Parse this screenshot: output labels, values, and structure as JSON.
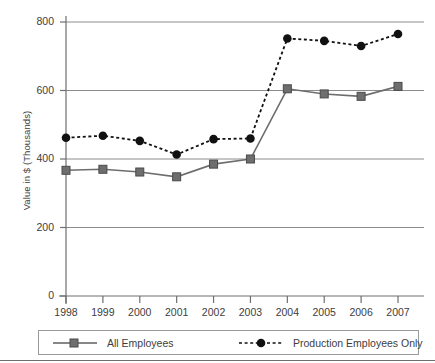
{
  "chart_data": {
    "type": "line",
    "title": "",
    "xlabel": "",
    "ylabel": "Value in $ (Thousands)",
    "categories": [
      "1998",
      "1999",
      "2000",
      "2001",
      "2002",
      "2003",
      "2004",
      "2005",
      "2006",
      "2007"
    ],
    "ylim": [
      0,
      800
    ],
    "yticks": [
      0,
      200,
      400,
      600,
      800
    ],
    "ytick_labels": [
      "0",
      "200",
      "400",
      "600",
      "800"
    ],
    "grid": true,
    "grid_axis": "y",
    "legend_position": "bottom",
    "series": [
      {
        "name": "All Employees",
        "values": [
          367,
          370,
          362,
          348,
          385,
          400,
          605,
          590,
          583,
          612
        ],
        "color": "#6e6e6e",
        "line_style": "solid",
        "marker": "square"
      },
      {
        "name": "Production Employees Only",
        "values": [
          462,
          468,
          453,
          413,
          458,
          460,
          752,
          745,
          730,
          765
        ],
        "color": "#111111",
        "line_style": "dotted",
        "marker": "circle"
      }
    ]
  },
  "legend": {
    "items": [
      {
        "label": "All Employees"
      },
      {
        "label": "Production Employees Only"
      }
    ]
  },
  "colors": {
    "all_employees": "#6e6e6e",
    "production_employees": "#111111",
    "gridline": "#8c8c8c",
    "axis": "#6f6f6f",
    "text": "#3d3d3d",
    "legend_border": "#9a9a9a"
  }
}
